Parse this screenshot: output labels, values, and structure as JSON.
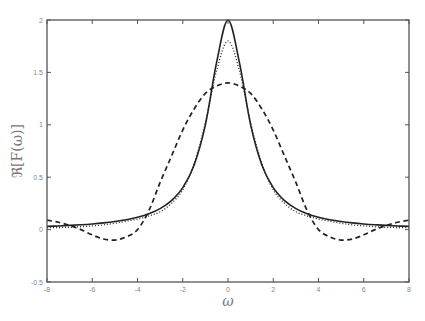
{
  "chart_data": {
    "type": "line",
    "title": "",
    "xlabel": "ω",
    "ylabel": "ℜ[F(ω)]",
    "xlim": [
      -8,
      8
    ],
    "ylim": [
      -0.5,
      2
    ],
    "xticks": [
      -8,
      -6,
      -4,
      -2,
      0,
      2,
      4,
      6,
      8
    ],
    "yticks": [
      -0.5,
      0,
      0.5,
      1,
      1.5,
      2
    ],
    "xtick_labels": [
      "-8",
      "-6",
      "-4",
      "-2",
      "0",
      "2",
      "4",
      "6",
      "8"
    ],
    "ytick_labels": [
      "-0.5",
      "0",
      "0.5",
      "1",
      "1.5",
      "2"
    ],
    "grid": false,
    "legend": null,
    "x": [
      0,
      0.5,
      1,
      1.5,
      2,
      2.5,
      3,
      3.5,
      4,
      4.5,
      5,
      5.5,
      6,
      6.5,
      7,
      7.5,
      8
    ],
    "symmetric_about_zero": true,
    "series": [
      {
        "name": "solid",
        "style": "solid",
        "values": [
          2.0,
          1.6,
          1.0,
          0.615,
          0.4,
          0.276,
          0.2,
          0.151,
          0.118,
          0.094,
          0.077,
          0.064,
          0.054,
          0.046,
          0.04,
          0.035,
          0.031
        ]
      },
      {
        "name": "dashed",
        "style": "dashed",
        "values": [
          1.4,
          1.37,
          1.3,
          1.15,
          0.95,
          0.7,
          0.45,
          0.18,
          0.0,
          -0.07,
          -0.1,
          -0.09,
          -0.05,
          0.0,
          0.04,
          0.07,
          0.09
        ]
      },
      {
        "name": "dotted",
        "style": "dotted",
        "values": [
          1.8,
          1.52,
          1.02,
          0.63,
          0.38,
          0.25,
          0.17,
          0.13,
          0.1,
          0.08,
          0.06,
          0.045,
          0.035,
          0.028,
          0.022,
          0.02,
          0.02
        ]
      }
    ]
  }
}
